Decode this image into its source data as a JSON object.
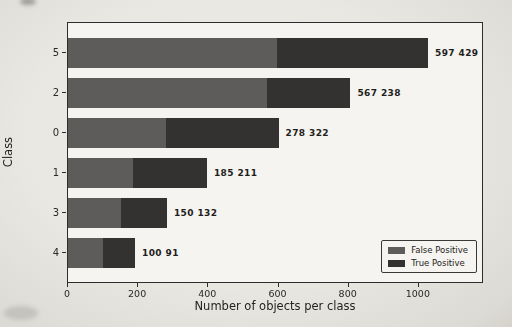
{
  "figure": {
    "xlabel": "Number of objects per class",
    "ylabel": "Class"
  },
  "chart_data": {
    "type": "bar",
    "orientation": "horizontal",
    "stacked": true,
    "title": "",
    "xlabel": "Number of objects per class",
    "ylabel": "Class",
    "categories": [
      "5",
      "2",
      "0",
      "1",
      "3",
      "4"
    ],
    "series": [
      {
        "name": "False Positive",
        "color": "#5d5c5a",
        "values": [
          597,
          567,
          278,
          185,
          150,
          100
        ]
      },
      {
        "name": "True Positive",
        "color": "#333230",
        "values": [
          429,
          238,
          322,
          211,
          132,
          91
        ]
      }
    ],
    "bar_labels": [
      "597 429",
      "567 238",
      "278 322",
      "185 211",
      "150 132",
      "100 91"
    ],
    "xticks": [
      "0",
      "200",
      "400",
      "600",
      "800",
      "1000"
    ],
    "xtick_values": [
      0,
      200,
      400,
      600,
      800,
      1000
    ],
    "xlim": [
      0,
      1180
    ],
    "grid": false,
    "legend": {
      "position": "lower right",
      "entries": [
        "False Positive",
        "True Positive"
      ]
    }
  }
}
